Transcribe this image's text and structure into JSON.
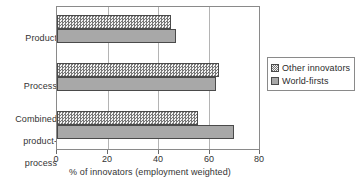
{
  "chart_data": {
    "type": "bar",
    "orientation": "horizontal",
    "title": "",
    "xlabel": "% of innovators (employment weighted)",
    "ylabel": "",
    "xlim": [
      0,
      80
    ],
    "xticks": [
      0,
      20,
      40,
      60,
      80
    ],
    "xtick_labels": [
      "0",
      "20",
      "40",
      "60",
      "80"
    ],
    "grid": true,
    "grid_axis": "x",
    "legend_position": "right",
    "categories": [
      "Product",
      "Process",
      "Combined\nproduct-\nprocess"
    ],
    "category_labels_flat": [
      "Product",
      "Process",
      "Combined product-process"
    ],
    "series": [
      {
        "name": "Other innovators",
        "pattern": "checker-hatch",
        "color": "#e9e9e9",
        "values": [
          45,
          64,
          56
        ]
      },
      {
        "name": "World-firsts",
        "pattern": "solid",
        "color": "#a8a8a8",
        "values": [
          47,
          63,
          70
        ]
      }
    ]
  },
  "legend": {
    "items": [
      {
        "label": "Other innovators"
      },
      {
        "label": "World-firsts"
      }
    ]
  },
  "axis": {
    "x_title": "% of innovators (employment weighted)",
    "tick_0": "0",
    "tick_1": "20",
    "tick_2": "40",
    "tick_3": "60",
    "tick_4": "80"
  },
  "categories": {
    "product": "Product",
    "process": "Process",
    "combined_line1": "Combined",
    "combined_line2": "product-",
    "combined_line3": "process"
  },
  "colors": {
    "frame": "#8a8a8a",
    "grid": "#b4b4b4",
    "bar_outline": "#4a4a4a",
    "series_other": "#e9e9e9",
    "series_world": "#a8a8a8",
    "text": "#333333"
  }
}
